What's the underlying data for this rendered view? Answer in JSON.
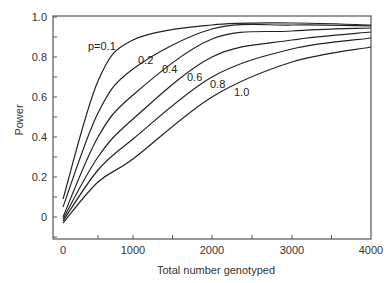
{
  "chart_data": {
    "type": "line",
    "title": "",
    "xlabel": "Total number genotyped",
    "ylabel": "Power",
    "xlim": [
      0,
      4000
    ],
    "ylim": [
      -0.1,
      1.0
    ],
    "grid": false,
    "legend": "inline curve labels",
    "x_ticks": [
      0,
      1000,
      2000,
      3000,
      4000
    ],
    "x_tick_labels": [
      "0",
      "1000",
      "2000",
      "3000",
      "4000"
    ],
    "y_ticks": [
      0,
      0.2,
      0.4,
      0.6,
      0.8,
      1.0
    ],
    "y_tick_labels": [
      "0",
      "0.2",
      "0.4",
      "0.6",
      "0.8",
      "1.0"
    ],
    "x": [
      0,
      500,
      1000,
      2000,
      3000,
      4000
    ],
    "series": [
      {
        "name": "p=0.1",
        "label": "p=0.1",
        "values": [
          0.09,
          0.68,
          0.885,
          0.96,
          0.97,
          0.96
        ]
      },
      {
        "name": "0.2",
        "label": "0.2",
        "values": [
          0.05,
          0.52,
          0.74,
          0.94,
          0.96,
          0.955
        ]
      },
      {
        "name": "0.4",
        "label": "0.4",
        "values": [
          0.0,
          0.4,
          0.61,
          0.89,
          0.93,
          0.945
        ]
      },
      {
        "name": "0.6",
        "label": "0.6",
        "values": [
          -0.01,
          0.3,
          0.49,
          0.8,
          0.885,
          0.925
        ]
      },
      {
        "name": "0.8",
        "label": "0.8",
        "values": [
          -0.02,
          0.235,
          0.39,
          0.7,
          0.84,
          0.895
        ]
      },
      {
        "name": "1.0",
        "label": "1.0",
        "values": [
          -0.03,
          0.175,
          0.29,
          0.6,
          0.775,
          0.85
        ]
      }
    ],
    "label_positions": [
      {
        "x": 88,
        "y": 50
      },
      {
        "x": 138,
        "y": 64
      },
      {
        "x": 162,
        "y": 73
      },
      {
        "x": 187,
        "y": 81
      },
      {
        "x": 210,
        "y": 88
      },
      {
        "x": 234,
        "y": 96
      }
    ]
  }
}
